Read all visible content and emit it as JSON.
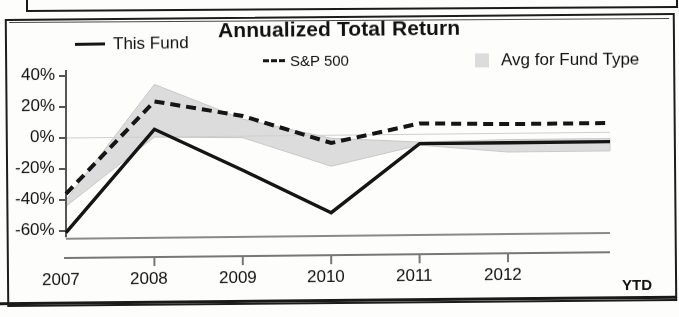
{
  "chart_data": {
    "type": "line",
    "title": "Annualized Total Return",
    "xlabel": "",
    "ylabel": "",
    "x": [
      "2007",
      "2008",
      "2009",
      "2010",
      "2011",
      "2012"
    ],
    "x_suffix_label": "YTD",
    "ylim": [
      -70,
      40
    ],
    "yticks": [
      40,
      20,
      0,
      -20,
      -40,
      -60
    ],
    "ytick_labels": [
      "40%",
      "20%",
      "0%",
      "-20%",
      "-40%",
      "-60%"
    ],
    "grid": false,
    "legend_position": "top",
    "series": [
      {
        "name": "This Fund",
        "style": "solid",
        "color": "#151515",
        "values": [
          -61,
          5,
          -22,
          -50,
          -6,
          -6
        ]
      },
      {
        "name": "S&P 500",
        "style": "dashed",
        "color": "#151515",
        "values": [
          -36,
          23,
          13,
          -5,
          7,
          6
        ]
      },
      {
        "name": "Avg for Fund Type",
        "style": "band",
        "color": "#dcdcdc",
        "upper": [
          -40,
          34,
          11,
          -2,
          -5,
          -4
        ],
        "lower": [
          -44,
          0,
          -1,
          -20,
          -7,
          -12
        ]
      }
    ]
  },
  "legend": [
    {
      "label": "This Fund",
      "marker": "solid-line-swatch"
    },
    {
      "label": "S&P 500",
      "marker": "dashed-line-swatch"
    },
    {
      "label": "Avg for Fund Type",
      "marker": "gray-box-swatch"
    }
  ],
  "axis": {
    "y_labels": [
      "40%",
      "20%",
      "0%",
      "-20%",
      "-40%",
      "-60%"
    ],
    "x_labels": [
      "2007",
      "2008",
      "2009",
      "2010",
      "2011",
      "2012"
    ],
    "ytd": "YTD"
  }
}
